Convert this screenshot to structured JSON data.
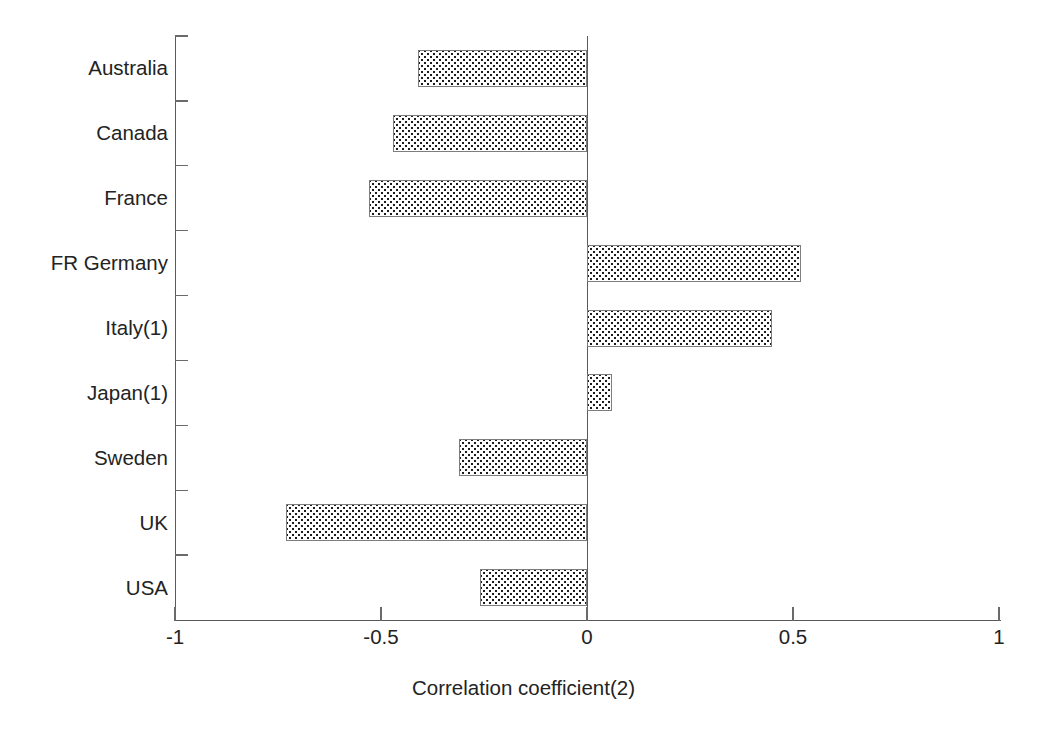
{
  "chart_data": {
    "type": "bar",
    "orientation": "horizontal",
    "title": "",
    "subtitle": "",
    "xlabel": "Correlation coefficient(2)",
    "ylabel": "",
    "categories": [
      "Australia",
      "Canada",
      "France",
      "FR Germany",
      "Italy(1)",
      "Japan(1)",
      "Sweden",
      "UK",
      "USA"
    ],
    "values": [
      -0.41,
      -0.47,
      -0.53,
      0.52,
      0.45,
      0.06,
      -0.31,
      -0.73,
      -0.26
    ],
    "series": [
      {
        "name": "Correlation coefficient(2)",
        "values": [
          -0.41,
          -0.47,
          -0.53,
          0.52,
          0.45,
          0.06,
          -0.31,
          -0.73,
          -0.26
        ]
      }
    ],
    "xlim": [
      -1,
      1
    ],
    "xticks": [
      -1,
      -0.5,
      0,
      0.5,
      1
    ],
    "xtick_labels": [
      "-1",
      "-0.5",
      "0",
      "0.5",
      "1"
    ],
    "grid": false,
    "legend": "none",
    "zero_line": true,
    "bar_fill": "dotted-pattern",
    "bar_edge_color": "#7d7d7d",
    "axis_color": "#5a5a5a",
    "text_color": "#232323",
    "background": "#ffffff"
  },
  "axis": {
    "x_title": "Correlation coefficient(2)",
    "tick_labels": [
      "-1",
      "-0.5",
      "0",
      "0.5",
      "1"
    ]
  },
  "categories": {
    "labels": [
      "Australia",
      "Canada",
      "France",
      "FR Germany",
      "Italy(1)",
      "Japan(1)",
      "Sweden",
      "UK",
      "USA"
    ]
  }
}
